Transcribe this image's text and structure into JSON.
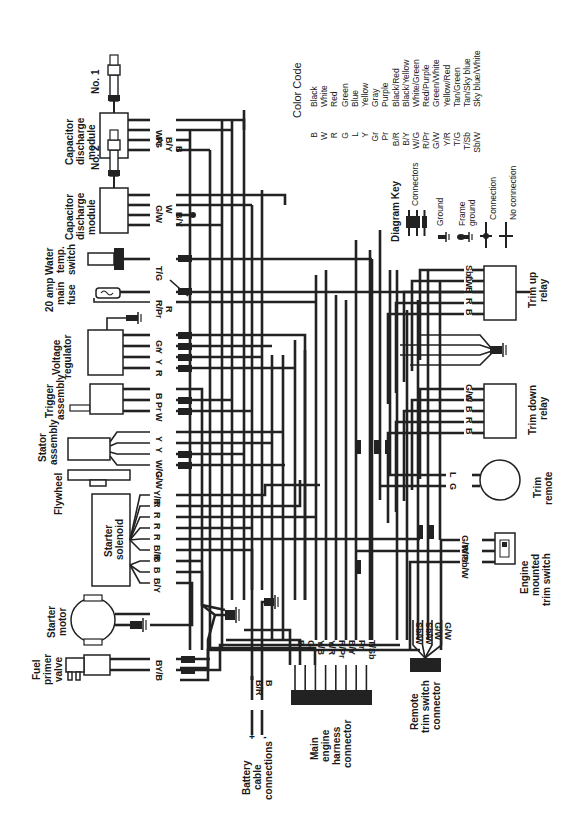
{
  "diagram": {
    "orientation": "rotated 90 degrees clockwise",
    "color_code": {
      "title": "Color Code",
      "entries": [
        {
          "code": "B",
          "color": "Black"
        },
        {
          "code": "W",
          "color": "White"
        },
        {
          "code": "R",
          "color": "Red"
        },
        {
          "code": "G",
          "color": "Green"
        },
        {
          "code": "L",
          "color": "Blue"
        },
        {
          "code": "Y",
          "color": "Yellow"
        },
        {
          "code": "Gr",
          "color": "Gray"
        },
        {
          "code": "Pr",
          "color": "Purple"
        },
        {
          "code": "B/R",
          "color": "Black/Red"
        },
        {
          "code": "B/Y",
          "color": "Black/Yellow"
        },
        {
          "code": "W/G",
          "color": "White/Green"
        },
        {
          "code": "R/Pr",
          "color": "Red/Purple"
        },
        {
          "code": "G/W",
          "color": "Green/White"
        },
        {
          "code": "Y/R",
          "color": "Yellow/Red"
        },
        {
          "code": "T/G",
          "color": "Tan/Green"
        },
        {
          "code": "T/Sb",
          "color": "Tan/Sky blue"
        },
        {
          "code": "Sb/W",
          "color": "Sky blue/White"
        }
      ]
    },
    "diagram_key": {
      "title": "Diagram Key",
      "items": [
        "Connectors",
        "Ground",
        "Frame ground",
        "Connection",
        "No connection"
      ]
    },
    "components": {
      "cdm1": {
        "label_lines": [
          "Capacitor",
          "discharge",
          "module"
        ],
        "plug": "No. 1",
        "wires": [
          "W/G",
          "Pr",
          "B/Y",
          "B"
        ]
      },
      "cdm2": {
        "label_lines": [
          "Capacitor",
          "discharge",
          "module"
        ],
        "plug": "No. 2",
        "wires": [
          "G/W",
          "W",
          "B/Y",
          "B"
        ]
      },
      "water_temp": {
        "label_lines": [
          "Water",
          "temp.",
          "switch"
        ],
        "wires": [
          "T/G"
        ]
      },
      "fuse": {
        "label_lines": [
          "20 amp",
          "main",
          "fuse"
        ],
        "wires": [
          "R/Pr",
          "R"
        ]
      },
      "voltage_regulator": {
        "label_lines": [
          "Voltage",
          "regulator"
        ],
        "wires": [
          "Gr",
          "Y",
          "Y",
          "R"
        ]
      },
      "trigger": {
        "label_lines": [
          "Trigger",
          "assembly"
        ],
        "wires": [
          "B",
          "Pr",
          "W"
        ]
      },
      "stator": {
        "label_lines": [
          "Stator",
          "assembly"
        ],
        "wires": [
          "Y",
          "Y",
          "W/G",
          "G/W"
        ]
      },
      "flywheel": {
        "label_lines": [
          "Flywheel"
        ]
      },
      "starter_solenoid": {
        "label_lines": [
          "Starter",
          "solenoid"
        ],
        "wires": [
          "Y/R",
          "R",
          "R",
          "R",
          "R",
          "B/R",
          "B",
          "B",
          "B/Y"
        ]
      },
      "starter_motor": {
        "label_lines": [
          "Starter",
          "motor"
        ]
      },
      "fuel_primer": {
        "label_lines": [
          "Fuel",
          "primer",
          "valve"
        ],
        "wires": [
          "B",
          "Y/B"
        ]
      },
      "battery": {
        "label_lines": [
          "Battery",
          "cable",
          "connections"
        ],
        "terminals": [
          "+",
          "-"
        ],
        "wires": [
          "B/R",
          "B"
        ]
      },
      "main_harness": {
        "label_lines": [
          "Main",
          "engine",
          "harness",
          "connector"
        ],
        "wires": [
          "B",
          "Gr",
          "Y/B",
          "Y/R",
          "R/Pr",
          "B/Y",
          "Pr",
          "T/Sb"
        ]
      },
      "remote_trim_connector": {
        "label_lines": [
          "Remote",
          "trim switch",
          "connector"
        ],
        "wires": [
          "Sb/W",
          "Sb/W",
          "G/W",
          "G/W"
        ]
      },
      "trim_up_relay": {
        "label_lines": [
          "Trim up",
          "relay"
        ],
        "wires": [
          "Sb/W",
          "L",
          "B",
          "R",
          "B"
        ]
      },
      "trim_down_relay": {
        "label_lines": [
          "Trim down",
          "relay"
        ],
        "wires": [
          "G/W",
          "G",
          "B",
          "R",
          "B"
        ]
      },
      "trim_remote": {
        "label_lines": [
          "Trim",
          "remote"
        ],
        "wires": [
          "L",
          "G"
        ]
      },
      "engine_trim_switch": {
        "label_lines": [
          "Engine",
          "mounted",
          "trim switch"
        ],
        "wires": [
          "G/W",
          "R/Pr",
          "Sb/W"
        ]
      }
    }
  }
}
